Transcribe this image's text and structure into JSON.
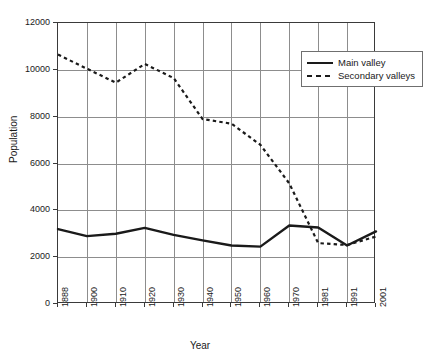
{
  "chart_data": {
    "type": "line",
    "title": "",
    "xlabel": "Year",
    "ylabel": "Population",
    "categories": [
      "1888",
      "1900",
      "1910",
      "1920",
      "1930",
      "1940",
      "1950",
      "1960",
      "1970",
      "1981",
      "1991",
      "2001"
    ],
    "x_tick_labels": [
      "1888",
      "1900",
      "1910",
      "1920",
      "1930",
      "1940",
      "1950",
      "1960",
      "1970",
      "1981",
      "1991",
      "2001"
    ],
    "y_tick_labels": [
      "0",
      "2000",
      "4000",
      "6000",
      "8000",
      "10000",
      "12000"
    ],
    "y_ticks": [
      0,
      2000,
      4000,
      6000,
      8000,
      10000,
      12000
    ],
    "ylim": [
      0,
      12000
    ],
    "grid": "both",
    "legend_position": "top-right-inside",
    "series": [
      {
        "name": "Main valley",
        "style": "solid",
        "color": "#1a1a1a",
        "values": [
          3200,
          2900,
          3000,
          3250,
          2950,
          2720,
          2500,
          2450,
          3350,
          3270,
          2500,
          3100
        ]
      },
      {
        "name": "Secondary valleys",
        "style": "dotted",
        "color": "#1a1a1a",
        "values": [
          10650,
          10050,
          9450,
          10250,
          9650,
          7900,
          7700,
          6800,
          5150,
          2600,
          2520,
          2880
        ]
      }
    ]
  },
  "legend": {
    "entries": [
      {
        "label": "Main valley",
        "style": "solid"
      },
      {
        "label": "Secondary valleys",
        "style": "dashed"
      }
    ]
  },
  "axes": {
    "x_title": "Year",
    "y_title": "Population"
  },
  "colors": {
    "line": "#1a1a1a",
    "grid": "#8d8d8d",
    "frame": "#3a3a3a",
    "background": "#ffffff"
  }
}
